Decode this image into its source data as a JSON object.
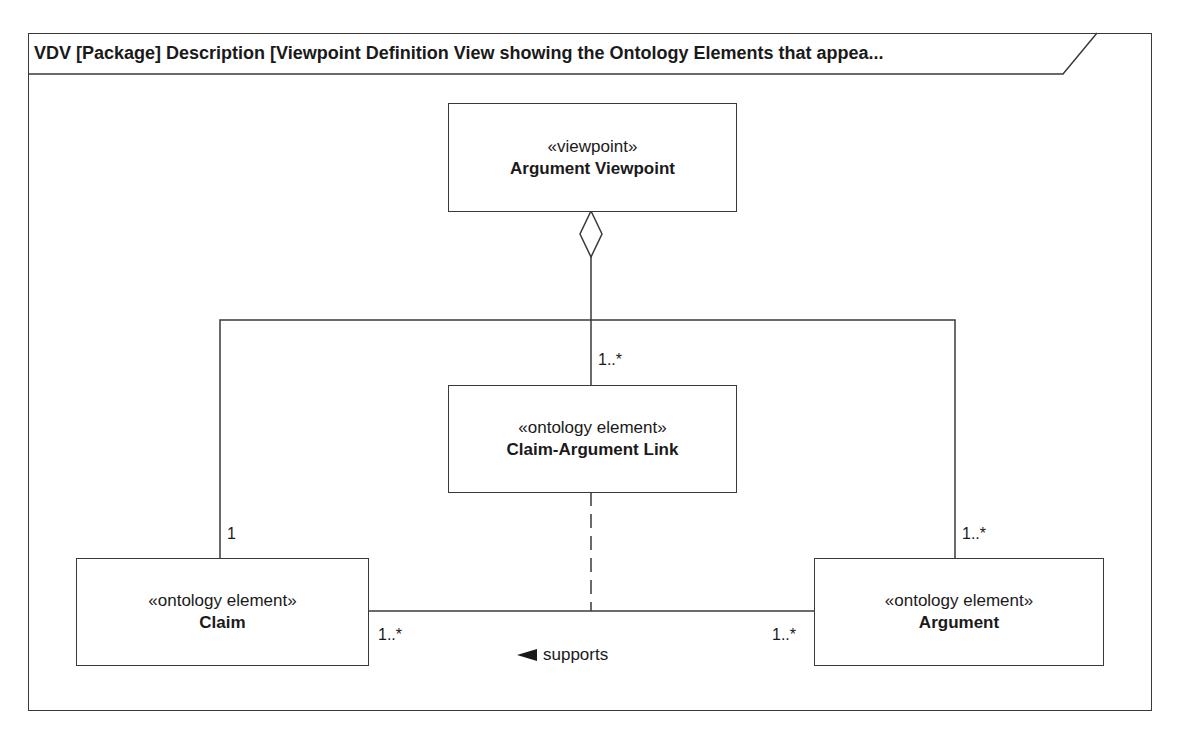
{
  "diagram": {
    "title": "VDV [Package] Description [Viewpoint Definition View showing the Ontology Elements that appea...",
    "blocks": {
      "viewpoint": {
        "stereotype": "«viewpoint»",
        "name": "Argument Viewpoint"
      },
      "link": {
        "stereotype": "«ontology element»",
        "name": "Claim-Argument Link"
      },
      "claim": {
        "stereotype": "«ontology element»",
        "name": "Claim"
      },
      "argument": {
        "stereotype": "«ontology element»",
        "name": "Argument"
      }
    },
    "multiplicities": {
      "link_top": "1..*",
      "claim_top": "1",
      "argument_top": "1..*",
      "claim_right": "1..*",
      "argument_left": "1..*"
    },
    "association": {
      "label": "supports",
      "direction_icon": "left-triangle"
    },
    "colors": {
      "line": "#3a3a3a",
      "text": "#1a1a1a",
      "background": "#ffffff"
    }
  }
}
